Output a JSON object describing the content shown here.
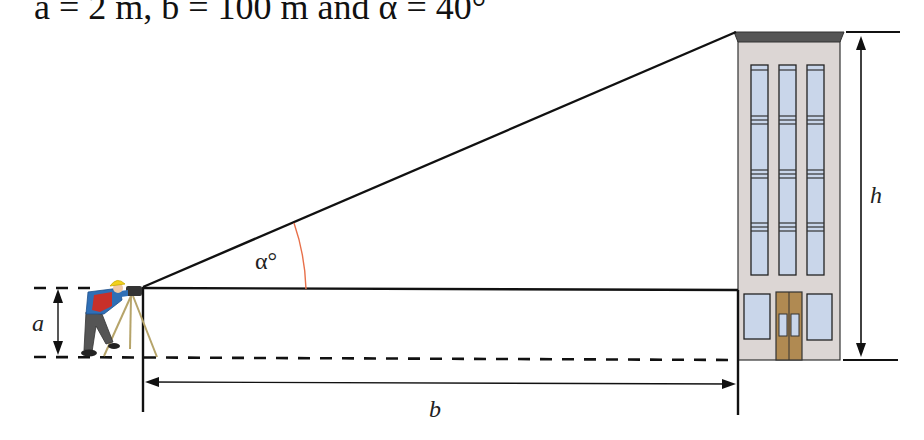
{
  "caption": {
    "text": "a = 2 m, b = 100 m and α = 40°"
  },
  "labels": {
    "a": "a",
    "b": "b",
    "h": "h",
    "alpha": "α°"
  },
  "given_values": {
    "a": "2 m",
    "b": "100 m",
    "alpha": "40°"
  },
  "colors": {
    "line": "#111111",
    "angle_arc": "#e8704a",
    "building_wall": "#dcd6d4",
    "building_roof": "#555555",
    "window": "#c9d6ea",
    "door": "#b08a52",
    "worker_helmet": "#f2d21b",
    "worker_shirt": "#2f6fb6",
    "worker_vest": "#c8302a",
    "worker_pants": "#555555",
    "tripod": "#b6a46a"
  },
  "figure": {
    "elements": [
      "surveyor-with-theodolite",
      "building",
      "line-of-sight",
      "horizontal-sight-line",
      "ground-dashed-line",
      "dimension-a",
      "dimension-b",
      "dimension-h",
      "angle-alpha"
    ]
  }
}
